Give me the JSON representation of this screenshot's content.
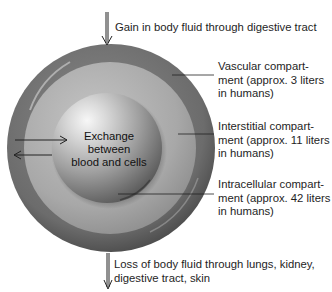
{
  "diagram": {
    "type": "body-fluid-compartments",
    "top_arrow_label": "Gain in body fluid through digestive tract",
    "bottom_arrow_label": {
      "lines": [
        "Loss of body fluid through lungs, kidney,",
        "digestive tract, skin"
      ]
    },
    "center_label": {
      "lines": [
        "Exchange",
        "between",
        "blood and cells"
      ]
    },
    "compartments": [
      {
        "name": "vascular",
        "lines": [
          "Vascular compart-",
          "ment (approx. 3 liters",
          "in humans)"
        ],
        "color": "#6f6f6f"
      },
      {
        "name": "interstitial",
        "lines": [
          "Interstitial compart-",
          "ment (approx. 11 liters",
          "in humans)"
        ],
        "color": "#a9a9a9"
      },
      {
        "name": "intracellular",
        "lines": [
          "Intracellular compart-",
          "ment (approx. 42 liters",
          "in humans)"
        ],
        "color": "#9c9c9c"
      }
    ],
    "colors": {
      "outer_ring": "#6a6a6a",
      "middle_band": "#acacac",
      "inner_sphere_highlight": "#f4f4f4",
      "inner_sphere_shadow": "#5a5a5a",
      "arrow": "#222222"
    }
  }
}
